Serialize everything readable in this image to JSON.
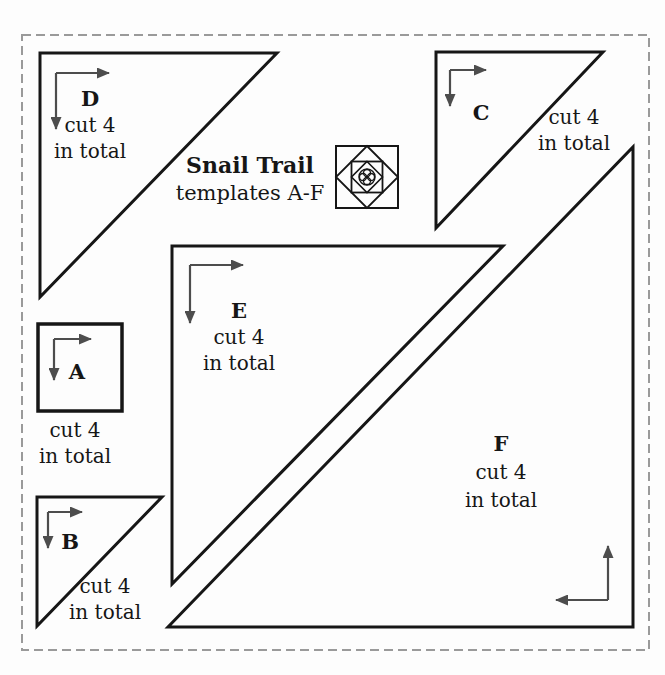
{
  "header": {
    "title": "Snail Trail",
    "subtitle": "templates A-F"
  },
  "templates": [
    {
      "label": "A",
      "cut_line1": "cut 4",
      "cut_line2": "in total"
    },
    {
      "label": "B",
      "cut_line1": "cut 4",
      "cut_line2": "in total"
    },
    {
      "label": "C",
      "cut_line1": "cut 4",
      "cut_line2": "in total"
    },
    {
      "label": "D",
      "cut_line1": "cut 4",
      "cut_line2": "in total"
    },
    {
      "label": "E",
      "cut_line1": "cut 4",
      "cut_line2": "in total"
    },
    {
      "label": "F",
      "cut_line1": "cut 4",
      "cut_line2": "in total"
    }
  ],
  "icons": {
    "snail_trail_block": "snail-trail-block-icon"
  },
  "colors": {
    "shape_stroke": "#161616",
    "grainline_arrow": "#4d4d4d",
    "dashed_border": "#9a9a9a",
    "text": "#161616",
    "background": "#fdfdfd"
  }
}
